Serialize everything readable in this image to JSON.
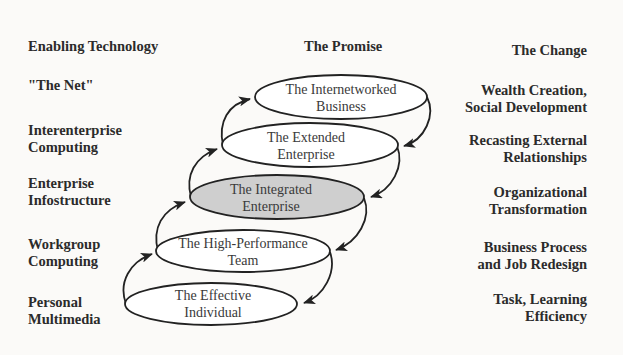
{
  "headers": {
    "left": "Enabling Technology",
    "center": "The Promise",
    "right": "The Change"
  },
  "enabling_technology": [
    {
      "line1": "\"The Net\"",
      "line2": ""
    },
    {
      "line1": "Interenterprise",
      "line2": "Computing"
    },
    {
      "line1": "Enterprise",
      "line2": "Infostructure"
    },
    {
      "line1": "Workgroup",
      "line2": "Computing"
    },
    {
      "line1": "Personal",
      "line2": "Multimedia"
    }
  ],
  "promise": [
    {
      "line1": "The Internetworked",
      "line2": "Business",
      "highlighted": false
    },
    {
      "line1": "The Extended",
      "line2": "Enterprise",
      "highlighted": false
    },
    {
      "line1": "The Integrated",
      "line2": "Enterprise",
      "highlighted": true
    },
    {
      "line1": "The High-Performance",
      "line2": "Team",
      "highlighted": false
    },
    {
      "line1": "The Effective",
      "line2": "Individual",
      "highlighted": false
    }
  ],
  "change": [
    {
      "line1": "Wealth Creation,",
      "line2": "Social Development"
    },
    {
      "line1": "Recasting External",
      "line2": "Relationships"
    },
    {
      "line1": "Organizational",
      "line2": "Transformation"
    },
    {
      "line1": "Business Process",
      "line2": "and Job Redesign"
    },
    {
      "line1": "Task, Learning",
      "line2": "Efficiency"
    }
  ],
  "colors": {
    "highlight_fill": "#cfcfcf",
    "ellipse_fill": "#ffffff",
    "stroke": "#222222",
    "background": "#fbfaf8"
  }
}
